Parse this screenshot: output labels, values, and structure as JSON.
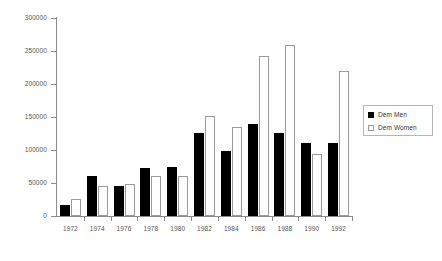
{
  "chart_data": {
    "type": "bar",
    "title": "",
    "xlabel": "",
    "ylabel": "",
    "ylim": [
      0,
      300000
    ],
    "grid": false,
    "legend_position": "right",
    "categories": [
      "1972",
      "1974",
      "1976",
      "1978",
      "1980",
      "1982",
      "1984",
      "1986",
      "1988",
      "1990",
      "1992"
    ],
    "ytick_labels": [
      "300000",
      "250000",
      "200000",
      "150000",
      "100000",
      "50000",
      "0"
    ],
    "ytick_values": [
      300000,
      250000,
      200000,
      150000,
      100000,
      50000,
      0
    ],
    "series": [
      {
        "name": "Dem Men",
        "color": "#000000",
        "values": [
          16000,
          60000,
          46000,
          73000,
          74000,
          126000,
          99000,
          140000,
          126000,
          111000,
          110000
        ]
      },
      {
        "name": "Dem Women",
        "color": "#ffffff",
        "values": [
          26000,
          45000,
          48000,
          61000,
          61000,
          151000,
          135000,
          243000,
          259000,
          94000,
          220000
        ]
      }
    ]
  },
  "legend": {
    "entries": [
      {
        "label": "Dem Men"
      },
      {
        "label": "Dem Women"
      }
    ]
  }
}
